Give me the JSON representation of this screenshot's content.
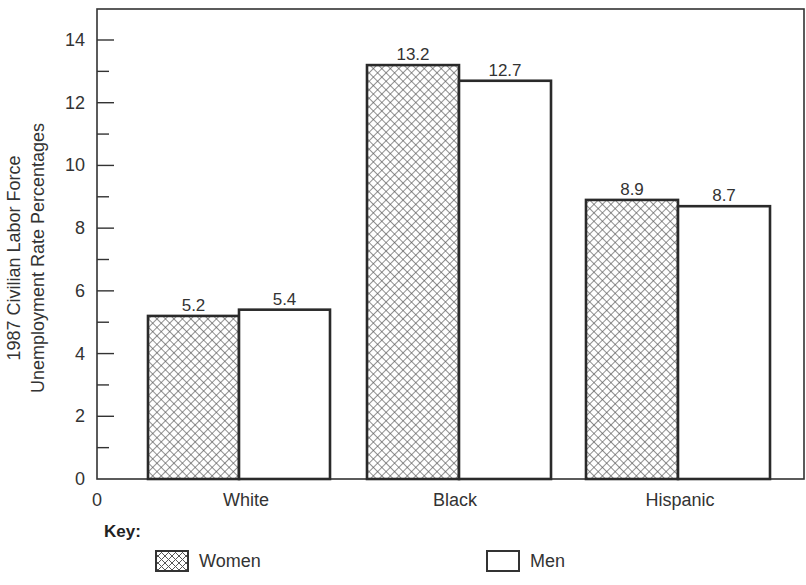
{
  "chart_data": {
    "type": "bar",
    "title": "",
    "xlabel": "",
    "ylabel": "1987 Civilian Labor Force Unemployment Rate Percentages",
    "ylabel_lines": [
      "1987 Civilian Labor Force",
      "Unemployment Rate Percentages"
    ],
    "categories": [
      "White",
      "Black",
      "Hispanic"
    ],
    "series": [
      {
        "name": "Women",
        "pattern": "crosshatch",
        "values": [
          5.2,
          13.2,
          8.9
        ]
      },
      {
        "name": "Men",
        "pattern": "white",
        "values": [
          5.4,
          12.7,
          8.7
        ]
      }
    ],
    "value_labels": [
      [
        "5.2",
        "5.4"
      ],
      [
        "13.2",
        "12.7"
      ],
      [
        "8.9",
        "8.7"
      ]
    ],
    "ylim": [
      0,
      15
    ],
    "y_ticks": [
      "0",
      "2",
      "4",
      "6",
      "8",
      "10",
      "12",
      "14"
    ],
    "x_origin_label": "0",
    "grid": false,
    "legend_position": "bottom"
  },
  "key": {
    "title": "Key:",
    "items": [
      {
        "label": "Women",
        "swatch": "crosshatch"
      },
      {
        "label": "Men",
        "swatch": "white"
      }
    ]
  },
  "colors": {
    "axis": "#333333",
    "bar_border": "#2a2a2a",
    "hatch": "#555555",
    "background": "#ffffff"
  }
}
